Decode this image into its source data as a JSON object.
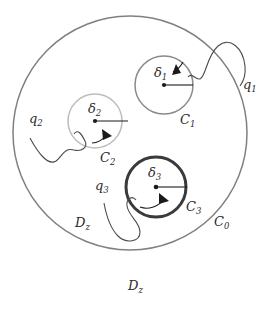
{
  "figure": {
    "background_color": "#ffffff",
    "width": 275,
    "height": 311
  },
  "domain_labels": {
    "inner": "D",
    "inner_sub": "z",
    "outer": "D",
    "outer_sub": "z"
  },
  "contours": [
    {
      "id": "C0",
      "label": "C",
      "label_sub": "0",
      "center_x": 130,
      "center_y": 133,
      "radius": 117,
      "color": "#808080",
      "stroke_width": 1.5,
      "label_x": 214,
      "label_y": 226,
      "has_center_dot": false,
      "has_radius_line": false,
      "has_arrow": false,
      "radius_symbol": "",
      "radius_symbol_sub": ""
    },
    {
      "id": "C1",
      "label": "C",
      "label_sub": "1",
      "center_x": 164,
      "center_y": 85,
      "radius": 29,
      "color": "#8a8a8a",
      "stroke_width": 1.5,
      "label_x": 180,
      "label_y": 124,
      "has_center_dot": true,
      "has_radius_line": true,
      "has_arrow": true,
      "radius_symbol": "δ",
      "radius_symbol_sub": "1",
      "radius_label_x": 154,
      "radius_label_y": 77,
      "radius_line_end_x": 193,
      "flow_label": "q",
      "flow_label_sub": "1"
    },
    {
      "id": "C2",
      "label": "C",
      "label_sub": "2",
      "center_x": 95,
      "center_y": 121,
      "radius": 27,
      "color": "#bdbdbd",
      "stroke_width": 1.5,
      "label_x": 100,
      "label_y": 162,
      "has_center_dot": true,
      "has_radius_line": true,
      "has_arrow": true,
      "radius_symbol": "δ",
      "radius_symbol_sub": "2",
      "radius_label_x": 88,
      "radius_label_y": 113,
      "radius_line_end_x": 128,
      "flow_label": "q",
      "flow_label_sub": "2"
    },
    {
      "id": "C3",
      "label": "C",
      "label_sub": "3",
      "center_x": 156,
      "center_y": 187,
      "radius": 30,
      "color": "#3a3a3a",
      "stroke_width": 3.0,
      "label_x": 186,
      "label_y": 211,
      "has_center_dot": true,
      "has_radius_line": true,
      "has_arrow": true,
      "radius_symbol": "δ",
      "radius_symbol_sub": "3",
      "radius_label_x": 148,
      "radius_label_y": 177,
      "radius_line_end_x": 187,
      "flow_label": "q",
      "flow_label_sub": "3"
    }
  ],
  "flows": [
    {
      "id": "q1",
      "label": "q",
      "label_sub": "1",
      "label_x": 243,
      "label_y": 89,
      "color": "#4a4a4a",
      "target_contour": "C1"
    },
    {
      "id": "q2",
      "label": "q",
      "label_sub": "2",
      "label_x": 29,
      "label_y": 123,
      "color": "#4a4a4a",
      "target_contour": "C2"
    },
    {
      "id": "q3",
      "label": "q",
      "label_sub": "3",
      "label_x": 95,
      "label_y": 190,
      "color": "#4a4a4a",
      "target_contour": "C3"
    }
  ],
  "region_label_inner": {
    "x": 75,
    "y": 227
  },
  "region_label_outer": {
    "x": 128,
    "y": 290
  }
}
